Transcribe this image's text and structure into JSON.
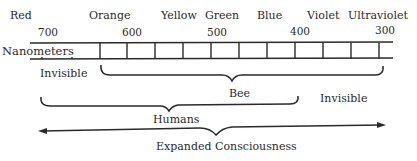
{
  "colors": {
    "ink": "#2a2a2a",
    "background": "#ffffff"
  },
  "color_labels": [
    {
      "name": "Red",
      "x": 10,
      "y": 10
    },
    {
      "name": "Orange",
      "x": 89,
      "y": 10
    },
    {
      "name": "Yellow",
      "x": 161,
      "y": 10
    },
    {
      "name": "Green",
      "x": 205,
      "y": 10
    },
    {
      "name": "Blue",
      "x": 257,
      "y": 10
    },
    {
      "name": "Violet",
      "x": 307,
      "y": 10
    },
    {
      "name": "Ultraviolet",
      "x": 348,
      "y": 10
    }
  ],
  "wavelength_ticks": [
    {
      "value": "700",
      "x": 38,
      "y": 27
    },
    {
      "value": "600",
      "x": 122,
      "y": 27
    },
    {
      "value": "500",
      "x": 207,
      "y": 27
    },
    {
      "value": "400",
      "x": 290,
      "y": 26
    },
    {
      "value": "300",
      "x": 375,
      "y": 25
    }
  ],
  "ruler": {
    "unit_label": "Nanometers",
    "x_start": 30,
    "x_end": 393,
    "y_top": 43,
    "y_bottom": 59,
    "dividers": [
      100,
      127,
      155,
      183,
      211,
      239,
      267,
      295,
      323,
      351,
      379
    ]
  },
  "ranges": [
    {
      "name": "Invisible",
      "role": "left-invisible-label",
      "x": 40,
      "y": 68
    },
    {
      "name": "Bee",
      "role": "bee-visible-range",
      "from_x": 100,
      "to_x": 382,
      "label_x": 229,
      "label_y": 88
    },
    {
      "name": "Invisible",
      "role": "right-invisible-label",
      "x": 320,
      "y": 93
    },
    {
      "name": "Humans",
      "role": "human-visible-range",
      "from_x": 40,
      "to_x": 299,
      "label_x": 153,
      "label_y": 110
    },
    {
      "name": "Expanded Consciousness",
      "role": "expanded-consciousness-range",
      "from_x": 38,
      "to_x": 386,
      "label_x": 156,
      "label_y": 141
    }
  ]
}
